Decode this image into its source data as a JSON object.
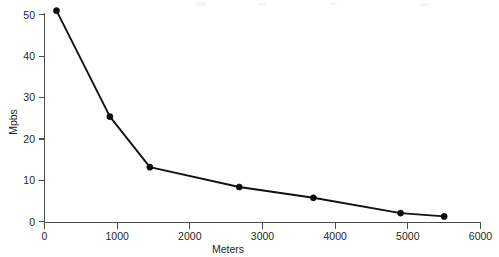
{
  "chart_data": {
    "type": "line",
    "title": "",
    "xlabel": "Meters",
    "ylabel": "Mpbs",
    "xlim": [
      0,
      6000
    ],
    "ylim": [
      0,
      50
    ],
    "grid": false,
    "legend": null,
    "x_ticks": [
      0,
      1000,
      2000,
      3000,
      4000,
      5000,
      6000
    ],
    "x_tick_labels": [
      "0",
      "1000",
      "2000",
      "3000",
      "4000",
      "5000",
      "6000"
    ],
    "y_ticks": [
      0,
      10,
      20,
      30,
      40,
      50
    ],
    "y_tick_labels": [
      "0",
      "10",
      "20",
      "30",
      "40",
      "50"
    ],
    "marker": "filled-circle",
    "line_color": "#111111",
    "marker_color": "#0d0d0d",
    "axis_color": "#4d4d4d",
    "background_color": "#ffffff",
    "x": [
      165,
      900,
      1450,
      2680,
      3700,
      4900,
      5500
    ],
    "values": [
      51.0,
      25.4,
      13.2,
      8.4,
      5.8,
      2.1,
      1.3
    ],
    "points": [
      {
        "x": 165,
        "y": 51.0
      },
      {
        "x": 900,
        "y": 25.4
      },
      {
        "x": 1450,
        "y": 13.2
      },
      {
        "x": 2680,
        "y": 8.4
      },
      {
        "x": 3700,
        "y": 5.8
      },
      {
        "x": 4900,
        "y": 2.1
      },
      {
        "x": 5500,
        "y": 1.3
      }
    ]
  }
}
